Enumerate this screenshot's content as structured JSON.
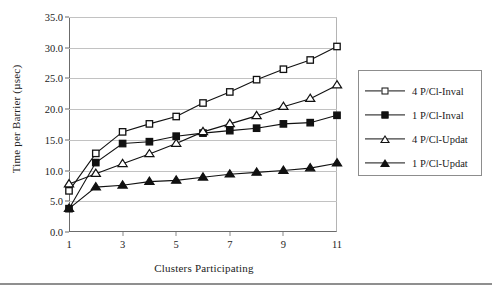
{
  "chart_data": {
    "type": "line",
    "title": "",
    "xlabel": "Clusters Participating",
    "ylabel": "Time per Barrier (µsec)",
    "x": [
      1,
      2,
      3,
      4,
      5,
      6,
      7,
      8,
      9,
      10,
      11
    ],
    "xlim": [
      1,
      11
    ],
    "ylim": [
      0.0,
      35.0
    ],
    "xticks": [
      1,
      3,
      5,
      7,
      9,
      11
    ],
    "xtick_labels": [
      "1",
      "3",
      "5",
      "7",
      "9",
      "11"
    ],
    "yticks": [
      0.0,
      5.0,
      10.0,
      15.0,
      20.0,
      25.0,
      30.0,
      35.0
    ],
    "ytick_labels": [
      "0.0",
      "5.0",
      "10.0",
      "15.0",
      "20.0",
      "25.0",
      "30.0",
      "35.0"
    ],
    "grid": true,
    "grid_axis": "y",
    "legend_position": "right-outside",
    "series": [
      {
        "name": "4 P/Cl-Inval",
        "marker": "square-open",
        "values": [
          6.7,
          12.8,
          16.3,
          17.6,
          18.8,
          21.0,
          22.8,
          24.8,
          26.5,
          28.0,
          30.2
        ]
      },
      {
        "name": "1 P/Cl-Inval",
        "marker": "square-filled",
        "values": [
          3.8,
          11.3,
          14.4,
          14.7,
          15.6,
          16.1,
          16.5,
          16.9,
          17.6,
          17.8,
          19.0
        ]
      },
      {
        "name": "4 P/Cl-Updat",
        "marker": "triangle-open",
        "values": [
          7.8,
          9.5,
          11.1,
          12.7,
          14.4,
          16.3,
          17.6,
          18.9,
          20.4,
          21.7,
          23.9
        ]
      },
      {
        "name": "1 P/Cl-Updat",
        "marker": "triangle-filled",
        "values": [
          3.8,
          7.3,
          7.6,
          8.2,
          8.4,
          8.9,
          9.4,
          9.7,
          10.0,
          10.4,
          11.2
        ]
      }
    ]
  },
  "legend": {
    "items": [
      {
        "label": "4 P/Cl-Inval",
        "marker": "square-open"
      },
      {
        "label": "1 P/Cl-Inval",
        "marker": "square-filled"
      },
      {
        "label": "4 P/Cl-Updat",
        "marker": "triangle-open"
      },
      {
        "label": "1 P/Cl-Updat",
        "marker": "triangle-filled"
      }
    ]
  },
  "colors": {
    "line": "#111111",
    "grid": "#c2c2c2",
    "axis": "#6b6b6b",
    "background": "#ffffff"
  }
}
